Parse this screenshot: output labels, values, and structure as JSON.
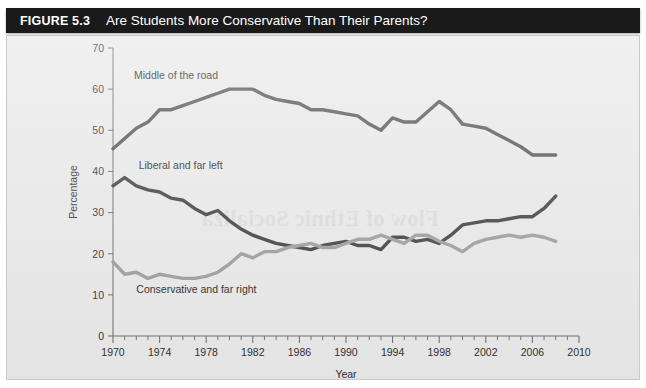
{
  "figure": {
    "number_label": "FIGURE 5.3",
    "title": "Are Students More Conservative Than Their Parents?"
  },
  "colors": {
    "title_bar_bg": "#1a1a1a",
    "title_text": "#ffffff",
    "panel_bg": "#e8e8e8",
    "axis": "#6f6f6f",
    "middle_of_the_road": "#4d4d4d",
    "liberal_and_far_left": "#3a3a3a",
    "conservative_and_far_right": "#9a9a9a"
  },
  "chart_data": {
    "type": "line",
    "title": "Are Students More Conservative Than Their Parents?",
    "xlabel": "Year",
    "ylabel": "Percentage",
    "xlim": [
      1970,
      2010
    ],
    "ylim": [
      0,
      70
    ],
    "x_major_ticks": [
      1970,
      1974,
      1978,
      1982,
      1986,
      1990,
      1994,
      1998,
      2002,
      2006,
      2010
    ],
    "x_tick_labels": [
      "1970",
      "1974",
      "1978",
      "1982",
      "1986",
      "1990",
      "1994",
      "1998",
      "2002",
      "2006",
      "2010"
    ],
    "x_minor_tick_step": 1,
    "y_ticks": [
      0,
      10,
      20,
      30,
      40,
      50,
      60,
      70
    ],
    "y_tick_labels": [
      "0",
      "10",
      "20",
      "30",
      "40",
      "50",
      "60",
      "70"
    ],
    "grid": false,
    "legend": "inline-labels",
    "x": [
      1970,
      1971,
      1972,
      1973,
      1974,
      1975,
      1976,
      1977,
      1978,
      1979,
      1980,
      1981,
      1982,
      1983,
      1984,
      1985,
      1986,
      1987,
      1988,
      1989,
      1990,
      1991,
      1992,
      1993,
      1994,
      1995,
      1996,
      1997,
      1998,
      1999,
      2000,
      2001,
      2002,
      2003,
      2004,
      2005,
      2006,
      2007,
      2008
    ],
    "series": [
      {
        "name": "Middle of the road",
        "color": "#4d4d4d",
        "label_text": "Middle of the road",
        "values": [
          45.5,
          48.0,
          50.5,
          52.0,
          55.0,
          55.0,
          56.0,
          57.0,
          58.0,
          59.0,
          60.0,
          60.0,
          60.0,
          58.5,
          57.5,
          57.0,
          56.5,
          55.0,
          55.0,
          54.5,
          54.0,
          53.5,
          51.5,
          50.0,
          53.0,
          52.0,
          52.0,
          54.5,
          57.0,
          55.0,
          51.5,
          51.0,
          50.5,
          49.0,
          47.5,
          46.0,
          44.0,
          44.0,
          44.0
        ]
      },
      {
        "name": "Liberal and far left",
        "color": "#3a3a3a",
        "label_text": "Liberal and far left",
        "values": [
          36.5,
          38.5,
          36.5,
          35.5,
          35.0,
          33.5,
          33.0,
          31.0,
          29.5,
          30.5,
          28.0,
          26.0,
          24.5,
          23.5,
          22.5,
          22.0,
          21.5,
          21.0,
          22.0,
          22.5,
          23.0,
          22.0,
          22.0,
          21.0,
          24.0,
          24.0,
          23.0,
          23.5,
          22.5,
          24.5,
          27.0,
          27.5,
          28.0,
          28.0,
          28.5,
          29.0,
          29.0,
          31.0,
          34.0
        ]
      },
      {
        "name": "Conservative and far right",
        "color": "#9a9a9a",
        "label_text": "Conservative and far right",
        "values": [
          18.0,
          15.0,
          15.5,
          14.0,
          15.0,
          14.5,
          14.0,
          14.0,
          14.5,
          15.5,
          17.5,
          20.0,
          19.0,
          20.5,
          20.5,
          21.5,
          22.0,
          22.5,
          21.5,
          21.5,
          22.5,
          23.5,
          23.5,
          24.5,
          23.5,
          22.5,
          24.5,
          24.5,
          23.0,
          22.0,
          20.5,
          22.5,
          23.5,
          24.0,
          24.5,
          24.0,
          24.5,
          24.0,
          23.0
        ]
      }
    ],
    "annotations": [
      {
        "text": "Middle of the road",
        "x": 1971.8,
        "y": 62.5
      },
      {
        "text": "Liberal and far left",
        "x": 1972.2,
        "y": 40.5
      },
      {
        "text": "Conservative and far right",
        "x": 1972.0,
        "y": 10.5
      }
    ]
  }
}
